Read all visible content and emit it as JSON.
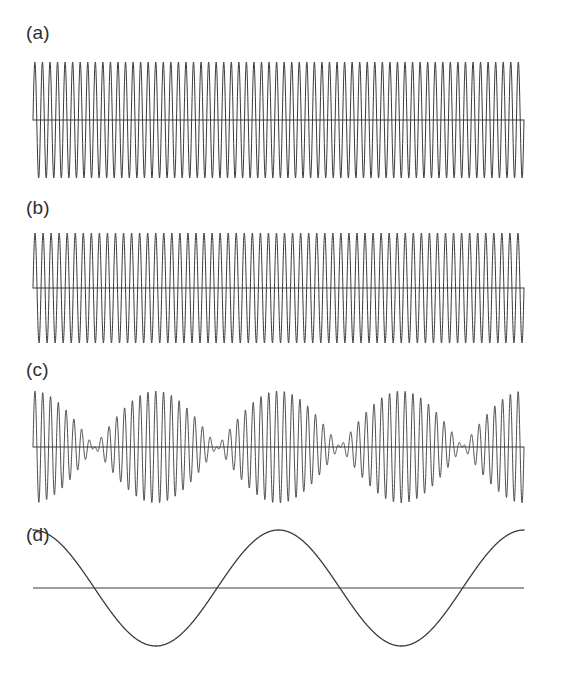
{
  "figure": {
    "background_color": "#ffffff",
    "ink_color": "#3a3a3a",
    "axis_color": "#3c3c3c",
    "width": 582,
    "height": 693
  },
  "panels": [
    {
      "id": "a",
      "label": "(a)",
      "description": "First pure sinusoid at frequency f1",
      "axis_y": 120,
      "x_start": 33,
      "x_end": 524,
      "amplitude": 58,
      "cycles": 65,
      "phase": 0,
      "stroke_width": 1.0
    },
    {
      "id": "b",
      "label": "(b)",
      "description": "Second pure sinusoid at slightly lower frequency f2",
      "axis_y": 103,
      "x_start": 33,
      "x_end": 524,
      "amplitude": 55,
      "cycles": 61,
      "phase": 0,
      "stroke_width": 1.0
    },
    {
      "id": "c",
      "label": "(c)",
      "description": "Superposition of the two sinusoids showing beats",
      "axis_y": 92,
      "x_start": 33,
      "x_end": 524,
      "amplitude": 56,
      "cycles": 63,
      "phase": 0,
      "stroke_width": 0.9,
      "envelope_cycles": 2,
      "envelope_phase": 0
    },
    {
      "id": "d",
      "label": "(d)",
      "description": "Slow beat envelope, the difference-frequency cosine",
      "axis_y": 78,
      "x_start": 33,
      "x_end": 524,
      "amplitude": 58,
      "cycles": 2,
      "phase": 0,
      "stroke_width": 1.3
    }
  ],
  "chart_data": {
    "type": "line",
    "title": "",
    "subtitle": "",
    "xlabel": "",
    "ylabel": "",
    "grid": false,
    "legend": "none",
    "x": {
      "min": 0,
      "max": 1,
      "units": "normalized time",
      "ticks": []
    },
    "y": {
      "min": -1,
      "max": 1,
      "units": "normalized amplitude",
      "ticks": []
    },
    "series": [
      {
        "name": "(a)",
        "kind": "sinusoid",
        "formula": "y = sin(2*pi*65*x)",
        "frequency_cycles": 65,
        "amplitude": 1.0,
        "phase": 0
      },
      {
        "name": "(b)",
        "kind": "sinusoid",
        "formula": "y = sin(2*pi*61*x)",
        "frequency_cycles": 61,
        "amplitude": 0.95,
        "phase": 0
      },
      {
        "name": "(c)",
        "kind": "beat-sum",
        "formula": "y = cos(2*pi*2*x) * sin(2*pi*63*x)",
        "carrier_cycles": 63,
        "envelope_cycles": 2,
        "amplitude": 0.97,
        "phase": 0
      },
      {
        "name": "(d)",
        "kind": "envelope",
        "formula": "y = cos(2*pi*2*x)",
        "frequency_cycles": 2,
        "amplitude": 1.0,
        "phase": 0
      }
    ],
    "annotations": [
      {
        "text": "(a)",
        "x": 0.0,
        "y": 1.0
      },
      {
        "text": "(b)",
        "x": 0.0,
        "y": 1.0
      },
      {
        "text": "(c)",
        "x": 0.0,
        "y": 1.0
      },
      {
        "text": "(d)",
        "x": 0.0,
        "y": 1.0
      }
    ]
  }
}
